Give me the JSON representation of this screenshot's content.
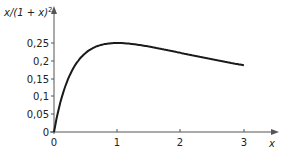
{
  "chart_data": {
    "type": "line",
    "title": "",
    "xlabel": "x",
    "ylabel": "x/(1 + x)²",
    "xlim": [
      0,
      3.5
    ],
    "ylim": [
      0,
      0.28
    ],
    "grid": false,
    "legend": null,
    "x_ticks": [
      "0",
      "1",
      "2",
      "3"
    ],
    "y_ticks": [
      "0",
      "0,05",
      "0,1",
      "0,15",
      "0,2",
      "0,25"
    ],
    "series": [
      {
        "name": "x/(1+x)^2",
        "x": [
          0,
          0.1,
          0.25,
          0.5,
          0.75,
          1,
          1.5,
          2,
          2.5,
          3
        ],
        "values": [
          0,
          0.083,
          0.16,
          0.222,
          0.245,
          0.25,
          0.24,
          0.222,
          0.204,
          0.1875
        ]
      }
    ],
    "colors": {
      "line": "#1a1a1a",
      "axis": "#555555"
    }
  },
  "labels": {
    "y_axis_title": "x/(1 + x)",
    "y_axis_sup": "2",
    "x_axis_title": "x",
    "x0": "0",
    "x1": "1",
    "x2": "2",
    "x3": "3",
    "y0": "0",
    "y005": "0,05",
    "y01": "0,1",
    "y015": "0,15",
    "y02": "0,2",
    "y025": "0,25"
  }
}
